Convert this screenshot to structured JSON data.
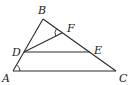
{
  "diagram": {
    "type": "geometry",
    "points": {
      "A": {
        "label": "A",
        "x": 13,
        "y": 71,
        "lx": 2,
        "ly": 82
      },
      "B": {
        "label": "B",
        "x": 43,
        "y": 19,
        "lx": 38,
        "ly": 14
      },
      "C": {
        "label": "C",
        "x": 116,
        "y": 71,
        "lx": 119,
        "ly": 82
      },
      "D": {
        "label": "D",
        "x": 24,
        "y": 52,
        "lx": 12,
        "ly": 56
      },
      "E": {
        "label": "E",
        "x": 90,
        "y": 52,
        "lx": 94,
        "ly": 54
      },
      "F": {
        "label": "F",
        "x": 62,
        "y": 33,
        "lx": 67,
        "ly": 32
      }
    },
    "segments": [
      {
        "from": "A",
        "to": "B",
        "name": "segment-ab"
      },
      {
        "from": "B",
        "to": "C",
        "name": "segment-bc"
      },
      {
        "from": "A",
        "to": "C",
        "name": "segment-ac"
      },
      {
        "from": "D",
        "to": "E",
        "name": "segment-de"
      },
      {
        "from": "D",
        "to": "F",
        "name": "segment-df"
      }
    ],
    "angle_marks": [
      {
        "vertex": "A",
        "name": "angle-a-mark"
      },
      {
        "vertex": "F",
        "name": "angle-dfb-mark"
      }
    ]
  }
}
